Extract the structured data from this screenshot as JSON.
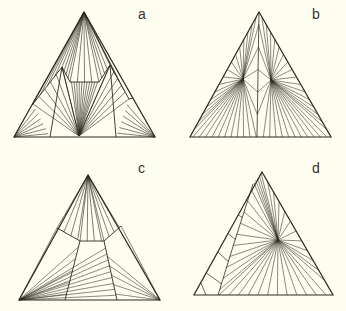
{
  "figure": {
    "background": "#fdfdf0",
    "line_color": "#2a2a22",
    "panels": [
      {
        "id": "a",
        "label": "a",
        "label_pos": [
          140,
          14
        ],
        "triangle": [
          [
            84,
            12
          ],
          [
            14,
            137
          ],
          [
            155,
            137
          ]
        ],
        "foci": [
          [
            84,
            12
          ],
          [
            79,
            136
          ],
          [
            14,
            137
          ],
          [
            155,
            137
          ]
        ],
        "inner": [
          [
            33,
            104
          ],
          [
            62,
            67
          ],
          [
            70,
            82
          ],
          [
            99,
            82
          ],
          [
            110,
            65
          ],
          [
            129,
            99
          ]
        ],
        "description": "Triangle with fans from apex, bottom-center point and base corners, inner hexagonal boundary"
      },
      {
        "id": "b",
        "label": "b",
        "label_pos": [
          314,
          14
        ],
        "triangle": [
          [
            259,
            12
          ],
          [
            190,
            137
          ],
          [
            331,
            137
          ]
        ],
        "foci": [
          [
            243,
            79
          ],
          [
            271,
            80
          ]
        ],
        "description": "Triangle with two interior star points radiating to edges"
      },
      {
        "id": "c",
        "label": "c",
        "label_pos": [
          140,
          165
        ],
        "triangle": [
          [
            88,
            175
          ],
          [
            19,
            300
          ],
          [
            160,
            300
          ]
        ],
        "foci": [
          [
            88,
            175
          ],
          [
            19,
            300
          ],
          [
            160,
            300
          ]
        ],
        "inner": [
          [
            57,
            228
          ],
          [
            80,
            241
          ],
          [
            104,
            241
          ],
          [
            121,
            226
          ]
        ],
        "description": "Triangle with fans from apex and base corners, asymmetric inner boundary"
      },
      {
        "id": "d",
        "label": "d",
        "label_pos": [
          314,
          165
        ],
        "triangle": [
          [
            262,
            172
          ],
          [
            194,
            295
          ],
          [
            333,
            295
          ]
        ],
        "foci": [
          [
            278,
            240
          ]
        ],
        "description": "Triangle with single interior star point and zigzag strip along left edge"
      }
    ]
  }
}
